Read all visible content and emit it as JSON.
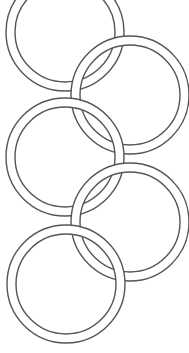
{
  "figure": {
    "background": "#ffffff",
    "stroke_color": "#555555",
    "band_fill": "#ffffff",
    "rings": [
      {
        "id": "ring-1",
        "cx": 65,
        "cy": 32,
        "r_outer": 59,
        "r_inner": 50
      },
      {
        "id": "ring-2",
        "cx": 130,
        "cy": 95,
        "r_outer": 59,
        "r_inner": 50
      },
      {
        "id": "ring-3",
        "cx": 65,
        "cy": 157,
        "r_outer": 59,
        "r_inner": 50
      },
      {
        "id": "ring-4",
        "cx": 130,
        "cy": 222,
        "r_outer": 59,
        "r_inner": 50
      },
      {
        "id": "ring-5",
        "cx": 66,
        "cy": 284,
        "r_outer": 59,
        "r_inner": 50
      }
    ]
  }
}
